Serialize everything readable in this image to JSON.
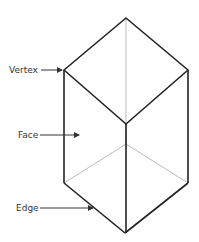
{
  "diagram": {
    "labels": {
      "vertex": "Vertex",
      "face": "Face",
      "edge": "Edge"
    },
    "colors": {
      "visible_edge": "#222222",
      "hidden_edge": "#bbbbbb",
      "label_text": "#333333",
      "arrow": "#333333",
      "background": "#ffffff"
    }
  }
}
